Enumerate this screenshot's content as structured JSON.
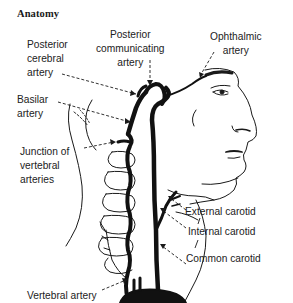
{
  "title": "Anatomy",
  "labels": {
    "posterior_cerebral": "Posterior\ncerebral\nartery",
    "posterior_communicating": "Posterior\ncommunicating\nartery",
    "ophthalmic": "Ophthalmic\nartery",
    "basilar": "Basilar\nartery",
    "junction_vertebral": "Junction of\nvertebral\narteries",
    "external_carotid": "External carotid",
    "internal_carotid": "Internal carotid",
    "common_carotid": "Common carotid",
    "vertebral": "Vertebral artery"
  },
  "colors": {
    "ink": "#1a1a1a",
    "background": "#ffffff"
  }
}
